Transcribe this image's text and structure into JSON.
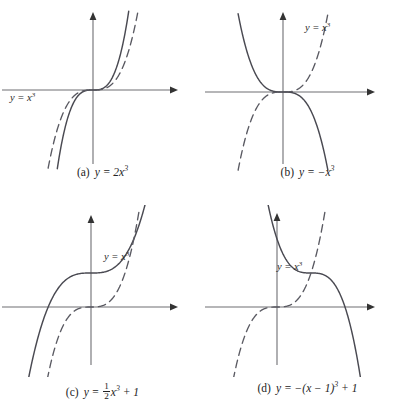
{
  "figure": {
    "kind": "math-figure",
    "stroke_solid": "#4a4a52",
    "stroke_dashed": "#5a5a62",
    "axis_color": "#6e6e73",
    "background": "#ffffff"
  },
  "panels": [
    {
      "id": "a",
      "caption_label": "(a)",
      "caption_eq_html": "y = 2x<sup>3</sup>",
      "curve_label": "y = x",
      "curve_label_sup": "3",
      "curve_label_x": 10,
      "curve_label_y": 92,
      "origin": {
        "x": 93,
        "y": 90
      },
      "scale": {
        "x": 34,
        "y": 34
      },
      "xaxis": {
        "x1": 2,
        "x2": 178
      },
      "yaxis": {
        "y1": 12,
        "y2": 164
      }
    },
    {
      "id": "b",
      "caption_label": "(b)",
      "caption_eq_html": "y = &minus;x<sup>3</sup>",
      "curve_label": "y = x",
      "curve_label_sup": "3",
      "curve_label_x": 100,
      "curve_label_y": 22,
      "origin": {
        "x": 78,
        "y": 92
      },
      "scale": {
        "x": 34,
        "y": 34
      },
      "xaxis": {
        "x1": -3,
        "x2": 170
      },
      "yaxis": {
        "y1": 12,
        "y2": 164
      }
    },
    {
      "id": "c",
      "caption_label": "(c)",
      "caption_eq_html": "y = <span class=\"frac\"><span class=\"num\">1</span><span class=\"den\">2</span></span>x<sup>3</sup> + 1",
      "curve_label": "y = x",
      "curve_label_sup": "3",
      "curve_label_x": 104,
      "curve_label_y": 46,
      "origin": {
        "x": 91,
        "y": 102
      },
      "scale": {
        "x": 34,
        "y": 34
      },
      "xaxis": {
        "x1": 2,
        "x2": 178
      },
      "yaxis": {
        "y1": 10,
        "y2": 160
      }
    },
    {
      "id": "d",
      "caption_label": "(d)",
      "caption_eq_html": "y = &minus;(x &minus; 1)<sup>3</sup> + 1",
      "curve_label": "y = x",
      "curve_label_sup": "3",
      "curve_label_x": 72,
      "curve_label_y": 56,
      "origin": {
        "x": 72,
        "y": 102
      },
      "scale": {
        "x": 34,
        "y": 34
      },
      "xaxis": {
        "x1": -3,
        "x2": 170
      },
      "yaxis": {
        "y1": 8,
        "y2": 160
      }
    }
  ],
  "chart_data": {
    "type": "line",
    "title": "",
    "xlabel": "x",
    "ylabel": "y",
    "grid": false,
    "legend": "inline-curve-labels",
    "panels": [
      {
        "panel": "a",
        "caption": "(a) y = 2x^3",
        "xlim": [
          -2.7,
          2.5
        ],
        "ylim": [
          -2.2,
          2.3
        ],
        "series": [
          {
            "name": "y = 2x^3",
            "style": "solid",
            "expression": "2*x^3",
            "x": [
              -1.05,
              -0.9,
              -0.75,
              -0.6,
              -0.45,
              -0.3,
              -0.15,
              0,
              0.15,
              0.3,
              0.45,
              0.6,
              0.75,
              0.9,
              1.05
            ],
            "y": [
              -2.315,
              -1.458,
              -0.844,
              -0.432,
              -0.182,
              -0.054,
              -0.007,
              0,
              0.007,
              0.054,
              0.182,
              0.432,
              0.844,
              1.458,
              2.315
            ]
          },
          {
            "name": "y = x^3",
            "style": "dashed",
            "expression": "x^3",
            "x": [
              -1.32,
              -1.1,
              -0.9,
              -0.7,
              -0.5,
              -0.3,
              -0.1,
              0,
              0.1,
              0.3,
              0.5,
              0.7,
              0.9,
              1.1,
              1.32
            ],
            "y": [
              -2.3,
              -1.331,
              -0.729,
              -0.343,
              -0.125,
              -0.027,
              -0.001,
              0,
              0.001,
              0.027,
              0.125,
              0.343,
              0.729,
              1.331,
              2.3
            ]
          }
        ]
      },
      {
        "panel": "b",
        "caption": "(b) y = -x^3",
        "xlim": [
          -2.3,
          2.7
        ],
        "ylim": [
          -2.2,
          2.3
        ],
        "series": [
          {
            "name": "y = -x^3",
            "style": "solid",
            "expression": "-x^3",
            "x": [
              -1.32,
              -1.1,
              -0.9,
              -0.7,
              -0.5,
              -0.3,
              -0.1,
              0,
              0.1,
              0.3,
              0.5,
              0.7,
              0.9,
              1.1,
              1.32
            ],
            "y": [
              2.3,
              1.331,
              0.729,
              0.343,
              0.125,
              0.027,
              0.001,
              0,
              -0.001,
              -0.027,
              -0.125,
              -0.343,
              -0.729,
              -1.331,
              -2.3
            ]
          },
          {
            "name": "y = x^3",
            "style": "dashed",
            "expression": "x^3",
            "x": [
              -1.32,
              -1.1,
              -0.9,
              -0.7,
              -0.5,
              -0.3,
              -0.1,
              0,
              0.1,
              0.3,
              0.5,
              0.7,
              0.9,
              1.1,
              1.32
            ],
            "y": [
              -2.3,
              -1.331,
              -0.729,
              -0.343,
              -0.125,
              -0.027,
              -0.001,
              0,
              0.001,
              0.027,
              0.125,
              0.343,
              0.729,
              1.331,
              2.3
            ]
          }
        ]
      },
      {
        "panel": "c",
        "caption": "(c) y = (1/2)x^3 + 1",
        "xlim": [
          -2.7,
          2.5
        ],
        "ylim": [
          -3.0,
          2.0
        ],
        "series": [
          {
            "name": "y = 0.5x^3 + 1",
            "style": "solid",
            "expression": "0.5*x^3 + 1",
            "x": [
              -2.45,
              -2.1,
              -1.8,
              -1.5,
              -1.2,
              -0.9,
              -0.6,
              -0.3,
              0,
              0.3,
              0.6,
              0.9,
              1.2,
              1.5,
              1.75
            ],
            "y": [
              -6.35,
              -3.63,
              -1.92,
              -0.69,
              0.14,
              0.64,
              0.89,
              0.99,
              1.0,
              1.01,
              1.11,
              1.36,
              1.86,
              2.69,
              3.68
            ]
          },
          {
            "name": "y = x^3",
            "style": "dashed",
            "expression": "x^3",
            "x": [
              -1.42,
              -1.2,
              -1.0,
              -0.8,
              -0.6,
              -0.4,
              -0.2,
              0,
              0.2,
              0.4,
              0.6,
              0.8,
              1.0,
              1.2,
              1.42
            ],
            "y": [
              -2.86,
              -1.728,
              -1.0,
              -0.512,
              -0.216,
              -0.064,
              -0.008,
              0,
              0.008,
              0.064,
              0.216,
              0.512,
              1.0,
              1.728,
              2.86
            ]
          }
        ]
      },
      {
        "panel": "d",
        "caption": "(d) y = -(x - 1)^3 + 1",
        "xlim": [
          -2.2,
          3.0
        ],
        "ylim": [
          -3.0,
          2.8
        ],
        "series": [
          {
            "name": "y = -(x-1)^3 + 1",
            "style": "solid",
            "expression": "-(x-1)^3 + 1",
            "x": [
              -0.35,
              -0.1,
              0.15,
              0.4,
              0.65,
              0.9,
              1.15,
              1.4,
              1.65,
              1.9,
              2.15,
              2.4,
              2.65,
              2.85
            ],
            "y": [
              3.46,
              2.33,
              1.61,
              1.22,
              1.04,
              1.001,
              0.997,
              0.936,
              0.726,
              0.271,
              -0.52,
              -1.74,
              -3.49,
              -5.33
            ]
          },
          {
            "name": "y = x^3",
            "style": "dashed",
            "expression": "x^3",
            "x": [
              -1.42,
              -1.2,
              -1.0,
              -0.8,
              -0.6,
              -0.4,
              -0.2,
              0,
              0.2,
              0.4,
              0.6,
              0.8,
              1.0,
              1.2,
              1.42
            ],
            "y": [
              -2.86,
              -1.728,
              -1.0,
              -0.512,
              -0.216,
              -0.064,
              -0.008,
              0,
              0.008,
              0.064,
              0.216,
              0.512,
              1.0,
              1.728,
              2.86
            ]
          }
        ]
      }
    ]
  }
}
